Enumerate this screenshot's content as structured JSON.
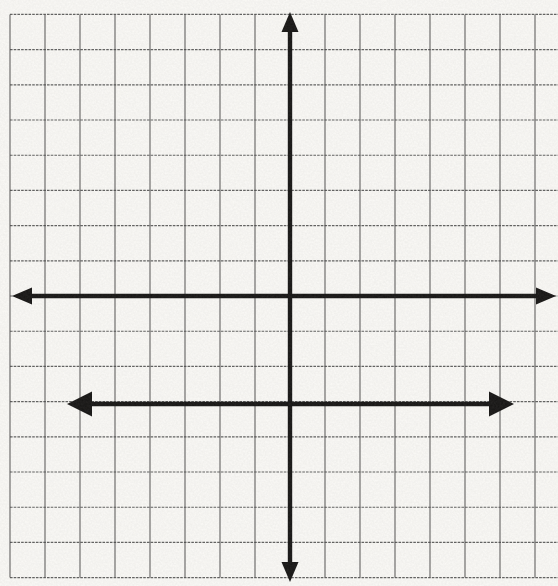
{
  "page": {
    "kind": "scanned worksheet coordinate grid",
    "paper_color": "#f9f8f5",
    "grid_line_color": "#464646",
    "ink_color": "#171615"
  },
  "chart_data": {
    "type": "line",
    "title": "",
    "xlabel": "",
    "ylabel": "",
    "grid": "on",
    "legend": "none",
    "x_tick_labels": [],
    "y_tick_labels": [],
    "xlim": [
      -8,
      7.7
    ],
    "ylim": [
      -8,
      8
    ],
    "axes": {
      "x_axis": {
        "arrows": "both-ends",
        "on_gridline": true
      },
      "y_axis": {
        "arrows": "both-ends",
        "on_gridline": true
      },
      "origin_cell_from_top_left": [
        8,
        8
      ]
    },
    "series": [
      {
        "name": "horizontal-double-arrow-segment",
        "equation": "y = -3",
        "x": [
          -6.4,
          6.4
        ],
        "y": [
          -3,
          -3
        ],
        "arrows": "both-ends"
      }
    ],
    "render": {
      "width": 558,
      "height": 586,
      "origin_px": {
        "x": 290,
        "y": 296
      },
      "cell_px": {
        "w": 35,
        "h": 35.2
      },
      "grid_cols": {
        "from": -8,
        "to": 7
      },
      "grid_rows": {
        "from": -8,
        "to": 8
      },
      "grid_extends_to_right_edge": true,
      "grid_color": "#464646",
      "grid_stroke": 1.15,
      "paper_color": "#f9f8f5",
      "ink_color": "#171615",
      "axis_stroke": 4.4,
      "lines": [
        {
          "name": "x-axis-line",
          "type": "h",
          "y_px": 296,
          "from_px": 12,
          "to_px": 556,
          "head_l": 20,
          "head_w": 17
        },
        {
          "name": "y-axis-line",
          "type": "v",
          "x_px": 290,
          "from_px": 12,
          "to_px": 582,
          "head_l": 20,
          "head_w": 17
        },
        {
          "name": "segment-y-equals-minus-3",
          "type": "h",
          "y_px": 404,
          "from_px": 67,
          "to_px": 514,
          "head_l": 25,
          "head_w": 25
        }
      ]
    }
  }
}
